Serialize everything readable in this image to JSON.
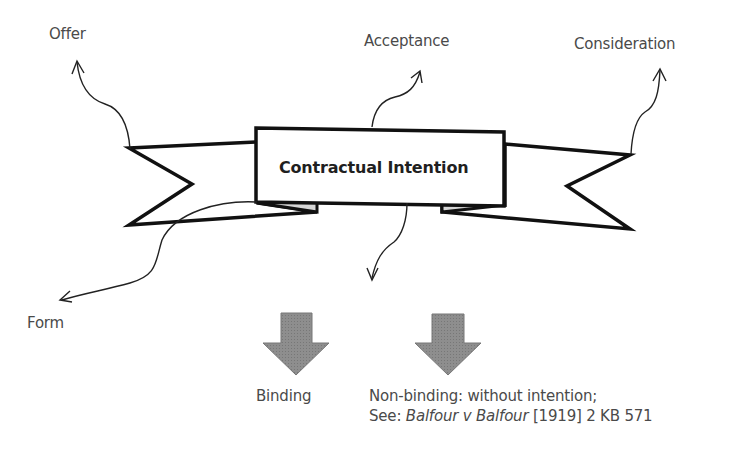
{
  "diagram": {
    "banner_title": "Contractual Intention",
    "elements": [
      {
        "id": "offer",
        "label": "Offer"
      },
      {
        "id": "acceptance",
        "label": "Acceptance"
      },
      {
        "id": "consideration",
        "label": "Consideration"
      },
      {
        "id": "form",
        "label": "Form"
      }
    ],
    "outcomes": {
      "binding": {
        "label": "Binding"
      },
      "non_binding": {
        "line1": "Non-binding: without intention;",
        "line2_prefix": "See: ",
        "case_name": "Balfour v Balfour",
        "citation": " [1919] 2 KB 571"
      }
    },
    "colors": {
      "outline": "#111111",
      "label_text": "#4a4a4a",
      "arrow_fill": "#8c8c8c",
      "fold_fill": "#d6d6d6"
    }
  }
}
